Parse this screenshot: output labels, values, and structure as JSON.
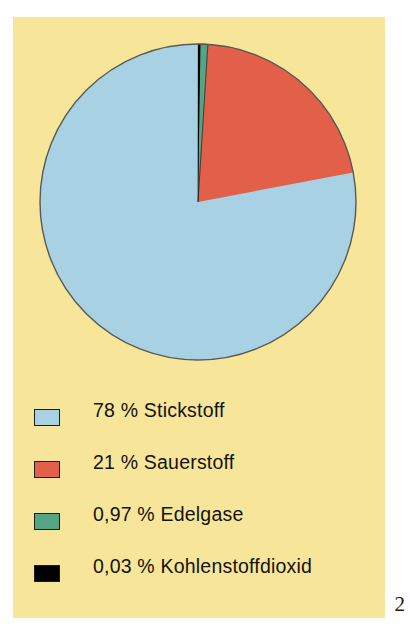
{
  "page": {
    "background_color": "#ffffff",
    "panel_color": "#f7e699",
    "page_number": "2"
  },
  "chart_data": {
    "type": "pie",
    "title": "",
    "subtitle": "",
    "xlabel": "",
    "ylabel": "",
    "grid": false,
    "legend_position": "bottom-left",
    "start_angle_deg": 0,
    "direction": "clockwise",
    "categories": [
      "Stickstoff",
      "Sauerstoff",
      "Edelgase",
      "Kohlenstoffdioxid"
    ],
    "values": [
      78,
      21,
      0.97,
      0.03
    ],
    "value_labels": [
      "78 %",
      "21 %",
      "0,97 %",
      "0,03 %"
    ],
    "unit": "%",
    "colors": [
      "#a8d2e4",
      "#e2604a",
      "#56a486",
      "#000000"
    ],
    "slice_order_clockwise": [
      "Kohlenstoffdioxid",
      "Edelgase",
      "Sauerstoff",
      "Stickstoff"
    ],
    "slices": [
      {
        "name": "Kohlenstoffdioxid",
        "value": 0.03,
        "color": "#000000",
        "start_deg": 0.0,
        "end_deg": 0.108
      },
      {
        "name": "Edelgase",
        "value": 0.97,
        "color": "#56a486",
        "start_deg": 0.108,
        "end_deg": 3.6
      },
      {
        "name": "Sauerstoff",
        "value": 21,
        "color": "#e2604a",
        "start_deg": 3.6,
        "end_deg": 79.2
      },
      {
        "name": "Stickstoff",
        "value": 78,
        "color": "#a8d2e4",
        "start_deg": 79.2,
        "end_deg": 360.0
      }
    ],
    "outline_color": "#5a5a52"
  },
  "legend": {
    "items": [
      {
        "label": "78 % Stickstoff",
        "color": "#a8d2e4",
        "swatch_name": "legend-swatch-stickstoff"
      },
      {
        "label": "21 % Sauerstoff",
        "color": "#e2604a",
        "swatch_name": "legend-swatch-sauerstoff"
      },
      {
        "label": "0,97 % Edelgase",
        "color": "#56a486",
        "swatch_name": "legend-swatch-edelgase"
      },
      {
        "label": "0,03 % Kohlenstoffdioxid",
        "color": "#000000",
        "swatch_name": "legend-swatch-kohlenstoffdioxid"
      }
    ]
  }
}
